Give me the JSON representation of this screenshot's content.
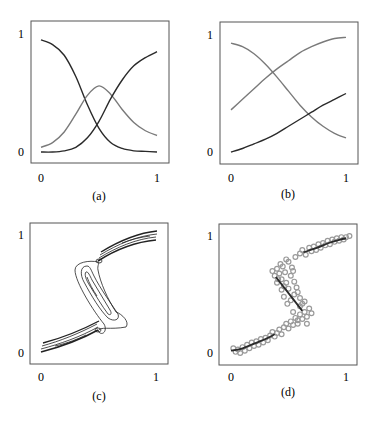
{
  "colors": {
    "frame": "#555555",
    "dark_curve": "#2a2a2a",
    "gray_curve": "#7a7a7a",
    "scatter_marker": "#9a9a9a",
    "contour": "#222222"
  },
  "chart_data": [
    {
      "id": "a",
      "type": "line",
      "caption": "(a)",
      "xlim": [
        0,
        1
      ],
      "ylim": [
        0,
        1
      ],
      "xticks": [
        "0",
        "1"
      ],
      "yticks": [
        "0",
        "1"
      ],
      "grid": false,
      "series": [
        {
          "name": "decreasing-sigmoid",
          "color": "dark",
          "x": [
            0,
            0.1,
            0.2,
            0.3,
            0.4,
            0.5,
            0.6,
            0.7,
            0.8,
            0.9,
            1.0
          ],
          "y": [
            0.95,
            0.91,
            0.82,
            0.64,
            0.4,
            0.2,
            0.08,
            0.03,
            0.01,
            0.005,
            0.0
          ]
        },
        {
          "name": "bump",
          "color": "gray",
          "x": [
            0,
            0.1,
            0.2,
            0.3,
            0.4,
            0.5,
            0.6,
            0.7,
            0.8,
            0.9,
            1.0
          ],
          "y": [
            0.04,
            0.08,
            0.17,
            0.32,
            0.48,
            0.56,
            0.49,
            0.36,
            0.25,
            0.18,
            0.14
          ]
        },
        {
          "name": "increasing-sigmoid",
          "color": "dark",
          "x": [
            0,
            0.1,
            0.2,
            0.3,
            0.4,
            0.5,
            0.6,
            0.7,
            0.8,
            0.9,
            1.0
          ],
          "y": [
            0.0,
            0.0,
            0.01,
            0.04,
            0.12,
            0.26,
            0.45,
            0.61,
            0.73,
            0.8,
            0.85
          ]
        }
      ]
    },
    {
      "id": "b",
      "type": "line",
      "caption": "(b)",
      "xlim": [
        0,
        1
      ],
      "ylim": [
        0,
        1
      ],
      "xticks": [
        "0",
        "1"
      ],
      "yticks": [
        "0",
        "1"
      ],
      "grid": false,
      "series": [
        {
          "name": "decreasing",
          "color": "gray",
          "x": [
            0,
            0.1,
            0.2,
            0.3,
            0.4,
            0.5,
            0.6,
            0.7,
            0.8,
            0.9,
            1.0
          ],
          "y": [
            0.93,
            0.9,
            0.84,
            0.75,
            0.64,
            0.52,
            0.4,
            0.3,
            0.22,
            0.16,
            0.12
          ]
        },
        {
          "name": "upper-increasing",
          "color": "gray",
          "x": [
            0,
            0.1,
            0.2,
            0.3,
            0.4,
            0.5,
            0.6,
            0.7,
            0.8,
            0.9,
            1.0
          ],
          "y": [
            0.36,
            0.45,
            0.54,
            0.63,
            0.71,
            0.78,
            0.85,
            0.9,
            0.94,
            0.97,
            0.98
          ]
        },
        {
          "name": "lower-increasing",
          "color": "dark",
          "x": [
            0,
            0.1,
            0.2,
            0.3,
            0.4,
            0.5,
            0.6,
            0.7,
            0.8,
            0.9,
            1.0
          ],
          "y": [
            0.0,
            0.03,
            0.07,
            0.11,
            0.16,
            0.22,
            0.28,
            0.34,
            0.4,
            0.45,
            0.5
          ]
        }
      ]
    },
    {
      "id": "c",
      "type": "contour",
      "caption": "(c)",
      "xlim": [
        0,
        1
      ],
      "ylim": [
        0,
        1
      ],
      "xticks": [
        "0",
        "1"
      ],
      "yticks": [
        "0",
        "1"
      ],
      "grid": false,
      "description": "Density contours of an S-shaped conditional distribution: two elongated branches (lower-left and upper-right) joined by a backward middle segment."
    },
    {
      "id": "d",
      "type": "scatter",
      "caption": "(d)",
      "xlim": [
        0,
        1
      ],
      "ylim": [
        0,
        1
      ],
      "xticks": [
        "0",
        "1"
      ],
      "yticks": [
        "0",
        "1"
      ],
      "grid": false,
      "fit_segments": [
        {
          "x": [
            0.0,
            0.1,
            0.2,
            0.3,
            0.38
          ],
          "y": [
            0.02,
            0.04,
            0.08,
            0.12,
            0.16
          ]
        },
        {
          "x": [
            0.39,
            0.62
          ],
          "y": [
            0.65,
            0.36
          ]
        },
        {
          "x": [
            0.63,
            0.75,
            0.85,
            0.95,
            1.0
          ],
          "y": [
            0.86,
            0.9,
            0.94,
            0.97,
            0.98
          ]
        }
      ],
      "points": [
        [
          0.02,
          0.04
        ],
        [
          0.04,
          0.01
        ],
        [
          0.06,
          0.03
        ],
        [
          0.08,
          0.0
        ],
        [
          0.1,
          0.05
        ],
        [
          0.12,
          0.02
        ],
        [
          0.14,
          0.07
        ],
        [
          0.16,
          0.04
        ],
        [
          0.18,
          0.09
        ],
        [
          0.2,
          0.06
        ],
        [
          0.22,
          0.1
        ],
        [
          0.24,
          0.07
        ],
        [
          0.26,
          0.12
        ],
        [
          0.28,
          0.09
        ],
        [
          0.3,
          0.13
        ],
        [
          0.32,
          0.11
        ],
        [
          0.34,
          0.15
        ],
        [
          0.36,
          0.18
        ],
        [
          0.38,
          0.14
        ],
        [
          0.4,
          0.17
        ],
        [
          0.42,
          0.2
        ],
        [
          0.44,
          0.16
        ],
        [
          0.46,
          0.22
        ],
        [
          0.48,
          0.25
        ],
        [
          0.5,
          0.21
        ],
        [
          0.52,
          0.27
        ],
        [
          0.54,
          0.24
        ],
        [
          0.56,
          0.3
        ],
        [
          0.58,
          0.28
        ],
        [
          0.6,
          0.33
        ],
        [
          0.62,
          0.29
        ],
        [
          0.64,
          0.35
        ],
        [
          0.66,
          0.31
        ],
        [
          0.68,
          0.38
        ],
        [
          0.62,
          0.42
        ],
        [
          0.6,
          0.47
        ],
        [
          0.58,
          0.52
        ],
        [
          0.55,
          0.5
        ],
        [
          0.52,
          0.45
        ],
        [
          0.5,
          0.55
        ],
        [
          0.48,
          0.6
        ],
        [
          0.46,
          0.57
        ],
        [
          0.44,
          0.63
        ],
        [
          0.42,
          0.68
        ],
        [
          0.4,
          0.72
        ],
        [
          0.38,
          0.66
        ],
        [
          0.36,
          0.7
        ],
        [
          0.4,
          0.6
        ],
        [
          0.45,
          0.74
        ],
        [
          0.5,
          0.78
        ],
        [
          0.52,
          0.66
        ],
        [
          0.55,
          0.61
        ],
        [
          0.57,
          0.56
        ],
        [
          0.6,
          0.4
        ],
        [
          0.64,
          0.44
        ],
        [
          0.46,
          0.48
        ],
        [
          0.49,
          0.42
        ],
        [
          0.43,
          0.76
        ],
        [
          0.48,
          0.8
        ],
        [
          0.53,
          0.73
        ],
        [
          0.56,
          0.82
        ],
        [
          0.6,
          0.85
        ],
        [
          0.62,
          0.88
        ],
        [
          0.65,
          0.84
        ],
        [
          0.68,
          0.9
        ],
        [
          0.7,
          0.87
        ],
        [
          0.72,
          0.91
        ],
        [
          0.74,
          0.88
        ],
        [
          0.76,
          0.93
        ],
        [
          0.78,
          0.9
        ],
        [
          0.8,
          0.94
        ],
        [
          0.82,
          0.92
        ],
        [
          0.84,
          0.96
        ],
        [
          0.86,
          0.93
        ],
        [
          0.88,
          0.97
        ],
        [
          0.9,
          0.95
        ],
        [
          0.92,
          0.98
        ],
        [
          0.94,
          0.96
        ],
        [
          0.96,
          0.99
        ],
        [
          0.98,
          0.97
        ],
        [
          1.0,
          0.99
        ],
        [
          1.03,
          1.0
        ],
        [
          0.54,
          0.35
        ],
        [
          0.58,
          0.25
        ],
        [
          0.66,
          0.25
        ],
        [
          0.7,
          0.34
        ],
        [
          0.44,
          0.54
        ],
        [
          0.41,
          0.63
        ],
        [
          0.54,
          0.7
        ],
        [
          0.47,
          0.69
        ]
      ]
    }
  ]
}
